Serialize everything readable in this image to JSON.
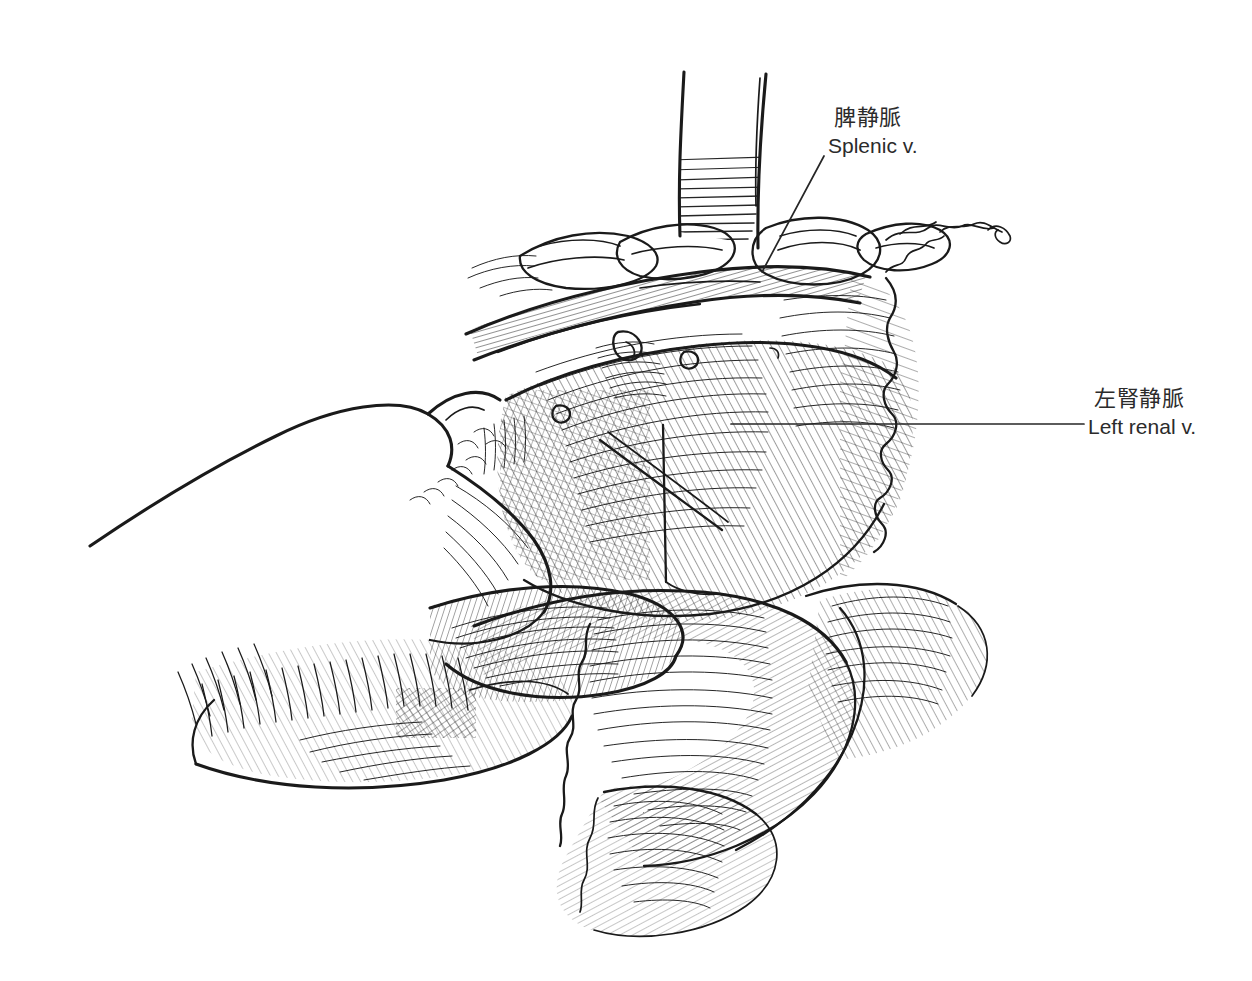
{
  "figure": {
    "kind": "medical-line-illustration",
    "style": "pen-and-ink hatched surgical atlas drawing",
    "background_color": "#ffffff",
    "ink_color": "#1a1a1a",
    "text_color": "#2b2b2b",
    "canvas": {
      "width": 1252,
      "height": 981
    }
  },
  "labels": [
    {
      "id": "splenic-vein",
      "jp": "脾静脈",
      "en": "Splenic v.",
      "leader": {
        "type": "diagonal",
        "x1": 824,
        "y1": 156,
        "x2": 762,
        "y2": 272
      },
      "text_x": 828,
      "text_y": 104
    },
    {
      "id": "left-renal-vein",
      "jp": "左腎静脈",
      "en": "Left renal v.",
      "leader": {
        "type": "horizontal",
        "x1": 731,
        "y1": 424,
        "x2": 1084,
        "y2": 424
      },
      "text_x": 1088,
      "text_y": 385
    }
  ]
}
